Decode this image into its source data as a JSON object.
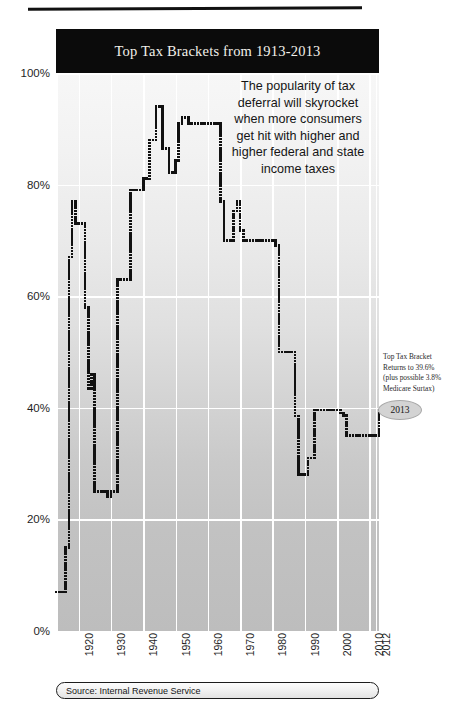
{
  "figure": {
    "title": "Top Tax Brackets from 1913-2013",
    "source": "Source: Internal Revenue Service",
    "callout": [
      "The popularity of tax",
      "deferral will skyrocket",
      "when more consumers",
      "get hit with higher and",
      "higher federal and state",
      "income taxes"
    ],
    "annotation": [
      "Top Tax Bracket",
      "Returns to 39.6%",
      "(plus possible 3.8%",
      "Medicare Surtax)"
    ],
    "year_badge": "2013",
    "colors": {
      "title_bar": "#0b0b0b",
      "title_text": "#f2f0ea",
      "series": "#111111",
      "gridline": "#ffffff",
      "badge_fill": "#d3d3d3"
    }
  },
  "chart_data": {
    "type": "line",
    "title": "Top Tax Brackets from 1913-2013",
    "subtitle": "",
    "xlabel": "",
    "ylabel": "",
    "xlim": [
      1913,
      2013
    ],
    "ylim": [
      0,
      100
    ],
    "grid": true,
    "legend": "none",
    "marker": "dotted-square",
    "ytick_labels": [
      "0%",
      "20%",
      "40%",
      "60%",
      "80%",
      "100%"
    ],
    "ytick_values": [
      0,
      20,
      40,
      60,
      80,
      100
    ],
    "xtick_labels": [
      "1920",
      "1930",
      "1940",
      "1950",
      "1960",
      "1970",
      "1980",
      "1990",
      "2000",
      "2010",
      "2012"
    ],
    "xtick_values": [
      1920,
      1930,
      1940,
      1950,
      1960,
      1970,
      1980,
      1990,
      2000,
      2010,
      2012
    ],
    "series_name": "Top marginal federal income tax rate",
    "x": [
      1913,
      1914,
      1915,
      1916,
      1917,
      1918,
      1919,
      1920,
      1921,
      1922,
      1923,
      1924,
      1925,
      1926,
      1927,
      1928,
      1929,
      1930,
      1931,
      1932,
      1933,
      1934,
      1935,
      1936,
      1937,
      1938,
      1939,
      1940,
      1941,
      1942,
      1943,
      1944,
      1945,
      1946,
      1947,
      1948,
      1949,
      1950,
      1951,
      1952,
      1953,
      1954,
      1955,
      1956,
      1957,
      1958,
      1959,
      1960,
      1961,
      1962,
      1963,
      1964,
      1965,
      1966,
      1967,
      1968,
      1969,
      1970,
      1971,
      1972,
      1973,
      1974,
      1975,
      1976,
      1977,
      1978,
      1979,
      1980,
      1981,
      1982,
      1983,
      1984,
      1985,
      1986,
      1987,
      1988,
      1989,
      1990,
      1991,
      1992,
      1993,
      1994,
      1995,
      1996,
      1997,
      1998,
      1999,
      2000,
      2001,
      2002,
      2003,
      2004,
      2005,
      2006,
      2007,
      2008,
      2009,
      2010,
      2011,
      2012,
      2013
    ],
    "y": [
      7,
      7,
      7,
      15,
      67,
      77,
      73,
      73,
      73,
      58,
      43.5,
      46,
      25,
      25,
      25,
      25,
      24,
      25,
      25,
      63,
      63,
      63,
      63,
      79,
      79,
      79,
      79,
      81.1,
      81,
      88,
      88,
      94,
      94,
      86.45,
      86.45,
      82.13,
      82.13,
      84.36,
      91,
      92,
      92,
      91,
      91,
      91,
      91,
      91,
      91,
      91,
      91,
      91,
      91,
      77,
      70,
      70,
      70,
      75.25,
      77,
      71.75,
      70,
      70,
      70,
      70,
      70,
      70,
      70,
      70,
      70,
      70,
      69.125,
      50,
      50,
      50,
      50,
      50,
      38.5,
      28,
      28,
      28,
      31,
      31,
      39.6,
      39.6,
      39.6,
      39.6,
      39.6,
      39.6,
      39.6,
      39.6,
      39.1,
      38.6,
      35,
      35,
      35,
      35,
      35,
      35,
      35,
      35,
      35,
      35,
      39.6
    ],
    "annotations": [
      {
        "text": "Top Tax Bracket Returns to 39.6% (plus possible 3.8% Medicare Surtax)",
        "x": 2013,
        "y": 39.6
      },
      {
        "text": "The popularity of tax deferral will skyrocket when more consumers get hit with higher and higher federal and state income taxes",
        "x": 1955,
        "y": 96
      }
    ]
  }
}
